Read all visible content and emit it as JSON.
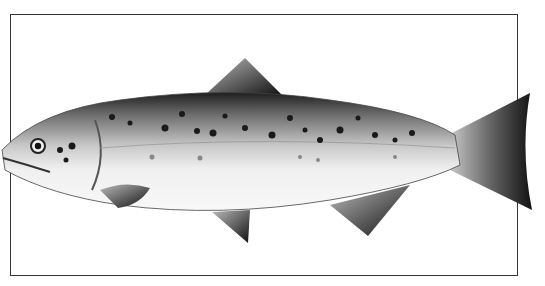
{
  "image": {
    "subject": "Atlantic salmon illustration",
    "style": "grayscale pencil drawing",
    "caption": "Salmon"
  },
  "colors": {
    "background": "#ffffff",
    "frame": "#333333",
    "body_dark": "#2a2a2a",
    "body_mid": "#8a8a8a",
    "belly": "#f2f2f2",
    "spots": "#1a1a1a"
  }
}
